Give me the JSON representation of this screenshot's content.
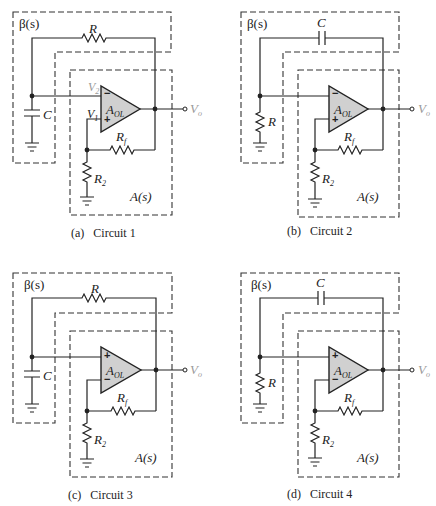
{
  "figure": {
    "circuits": [
      {
        "id": "a",
        "caption_letter": "(a)",
        "caption_name": "Circuit 1",
        "beta_label": "β(s)",
        "a_label": "A(s)",
        "feedback_element": "R",
        "shunt_element": "C",
        "opamp_label": "A",
        "opamp_sub": "OL",
        "top_input_sign": "−",
        "bottom_input_sign": "+",
        "v2_label": "V",
        "v2_sub": "2",
        "v1_label": "V",
        "v1_sub": "1",
        "rf_label": "R",
        "rf_sub": "f",
        "r2_label": "R",
        "r2_sub": "2",
        "vo_label": "V",
        "vo_sub": "o"
      },
      {
        "id": "b",
        "caption_letter": "(b)",
        "caption_name": "Circuit 2",
        "beta_label": "β(s)",
        "a_label": "A(s)",
        "feedback_element": "C",
        "shunt_element": "R",
        "opamp_label": "A",
        "opamp_sub": "OL",
        "top_input_sign": "−",
        "bottom_input_sign": "+",
        "rf_label": "R",
        "rf_sub": "f",
        "r2_label": "R",
        "r2_sub": "2",
        "vo_label": "V",
        "vo_sub": "o"
      },
      {
        "id": "c",
        "caption_letter": "(c)",
        "caption_name": "Circuit 3",
        "beta_label": "β(s)",
        "a_label": "A(s)",
        "feedback_element": "R",
        "shunt_element": "C",
        "opamp_label": "A",
        "opamp_sub": "OL",
        "top_input_sign": "+",
        "bottom_input_sign": "−",
        "rf_label": "R",
        "rf_sub": "f",
        "r2_label": "R",
        "r2_sub": "2",
        "vo_label": "V",
        "vo_sub": "o"
      },
      {
        "id": "d",
        "caption_letter": "(d)",
        "caption_name": "Circuit 4",
        "beta_label": "β(s)",
        "a_label": "A(s)",
        "feedback_element": "C",
        "shunt_element": "R",
        "opamp_label": "A",
        "opamp_sub": "OL",
        "top_input_sign": "+",
        "bottom_input_sign": "−",
        "rf_label": "R",
        "rf_sub": "f",
        "r2_label": "R",
        "r2_sub": "2",
        "vo_label": "V",
        "vo_sub": "o"
      }
    ]
  }
}
